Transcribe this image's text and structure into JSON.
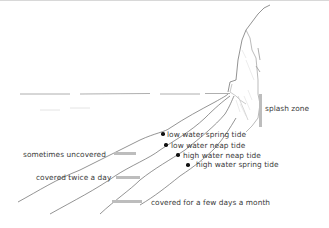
{
  "diagram": {
    "type": "seashore-zonation-sketch",
    "tide_levels": [
      {
        "label": "low water spring tide"
      },
      {
        "label": "low water neap tide"
      },
      {
        "label": "high water neap tide"
      },
      {
        "label": "high water spring tide"
      }
    ],
    "zones": [
      {
        "label": "splash zone"
      },
      {
        "label": "sometimes uncovered"
      },
      {
        "label": "covered twice a day"
      },
      {
        "label": "covered for a few days a month"
      }
    ],
    "colors": {
      "text": "#3a3a3a",
      "lines": "#555555",
      "zone_bar": "#bdbdbd",
      "marker": "#111111"
    }
  }
}
